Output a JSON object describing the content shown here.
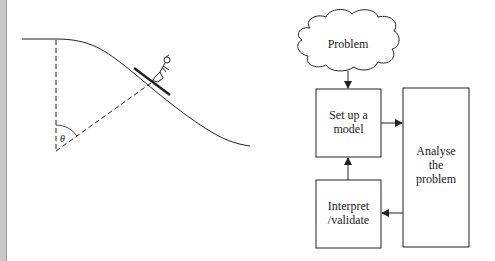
{
  "left_figure": {
    "description": "Skier on a curved slope with angle from vertical",
    "angle_label": "θ"
  },
  "flowchart": {
    "start": {
      "label": "Problem",
      "shape": "cloud"
    },
    "boxes": [
      {
        "id": "setup",
        "lines": [
          "Set up a",
          "model"
        ]
      },
      {
        "id": "interpret",
        "lines": [
          "Interpret",
          "/validate"
        ]
      },
      {
        "id": "analyse",
        "lines": [
          "Analyse",
          "the",
          "problem"
        ]
      }
    ],
    "arrows": [
      {
        "from": "Problem",
        "to": "Set up a model"
      },
      {
        "from": "Set up a model",
        "to": "Analyse the problem"
      },
      {
        "from": "Analyse the problem",
        "to": "Interpret /validate"
      },
      {
        "from": "Interpret /validate",
        "to": "Set up a model"
      }
    ]
  },
  "colors": {
    "line": "#222222",
    "edge_bar": "#c9c9c9",
    "background": "#ffffff"
  }
}
